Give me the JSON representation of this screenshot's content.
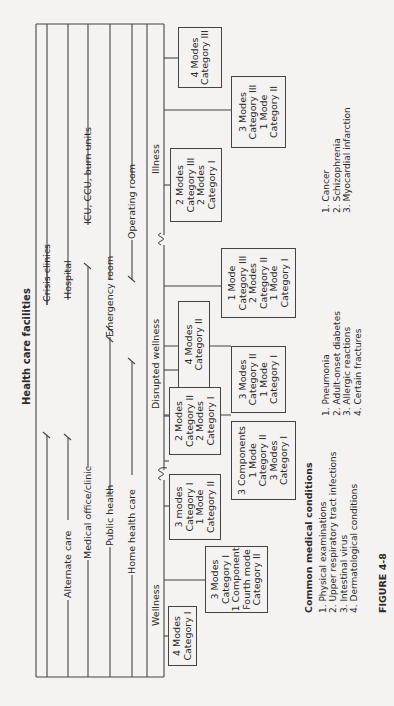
{
  "title": "Health care facilities",
  "facility_lines": {
    "crisis_clinics": "Crisis clinics",
    "alternate_care": "Alternate care",
    "hospital": "Hospital",
    "medical_office": "Medical office/clinic",
    "icu": "ICU, CCU, burn units",
    "public_health": "Public health",
    "emergency_room": "Emergency room",
    "home_health_care": "Home health care",
    "operating_room": "Operating room"
  },
  "stages": {
    "wellness": "Wellness",
    "disrupted_wellness": "Disrupted wellness",
    "illness": "Illness"
  },
  "boxes": [
    {
      "id": "w1",
      "lines": [
        "4 Modes",
        "Category I"
      ]
    },
    {
      "id": "w2",
      "lines": [
        "3 Modes",
        "Category I",
        "1 Component",
        "Fourth mode",
        "Category II"
      ]
    },
    {
      "id": "w3",
      "lines": [
        "3 modes",
        "Category I",
        "1 Mode",
        "Category II"
      ]
    },
    {
      "id": "d1",
      "lines": [
        "3 Components",
        "1 Mode",
        "Category II",
        "3 Modes",
        "Category I"
      ]
    },
    {
      "id": "d2",
      "lines": [
        "2 Modes",
        "Category II",
        "2 Modes",
        "Category I"
      ]
    },
    {
      "id": "d3",
      "lines": [
        "3 Modes",
        "Category II",
        "1 Mode",
        "Category I"
      ]
    },
    {
      "id": "d4",
      "lines": [
        "4 Modes",
        "Category II"
      ]
    },
    {
      "id": "d5",
      "lines": [
        "1 Mode",
        "Category III",
        "2 Modes",
        "Category II",
        "1 Mode",
        "Category I"
      ]
    },
    {
      "id": "i1",
      "lines": [
        "2 Modes",
        "Category III",
        "2 Modes",
        "Category I"
      ]
    },
    {
      "id": "i2",
      "lines": [
        "3 Modes",
        "Category III",
        "1 Mode",
        "Category II"
      ]
    },
    {
      "id": "i3",
      "lines": [
        "4 Modes",
        "Category III"
      ]
    }
  ],
  "conditions": {
    "heading": "Common medical conditions",
    "wellness": [
      "1. Physical examinations",
      "2. Upper respiratory tract infections",
      "3. Intestinal virus",
      "4. Dermatological conditions"
    ],
    "disrupted_wellness": [
      "1. Pneumonia",
      "2. Adult-onset diabetes",
      "3. Allergic reactions",
      "4. Certain fractures"
    ],
    "illness": [
      "1. Cancer",
      "2. Schizophrenia",
      "3. Myocardial infarction"
    ]
  },
  "figure_label": "FIGURE 4-8"
}
